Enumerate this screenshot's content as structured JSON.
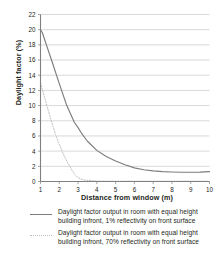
{
  "chart_data": {
    "type": "line",
    "title": "",
    "xlabel": "Distance from window (m)",
    "ylabel": "Daylight factor (%)",
    "xlim": [
      1,
      10
    ],
    "ylim": [
      0,
      22
    ],
    "xticks": [
      1,
      2,
      3,
      4,
      5,
      6,
      7,
      8,
      9,
      10
    ],
    "yticks": [
      0,
      2,
      4,
      6,
      8,
      10,
      12,
      14,
      16,
      18,
      20,
      22
    ],
    "xtick_labels": [
      "1",
      "2",
      "3",
      "4",
      "5",
      "6",
      "7",
      "8",
      "9",
      "10"
    ],
    "ytick_labels": [
      "0",
      "2",
      "4",
      "6",
      "8",
      "10",
      "12",
      "14",
      "16",
      "18",
      "20",
      "22"
    ],
    "grid": "horizontal",
    "legend_position": "bottom",
    "series": [
      {
        "name": "Daylight factor output in room with equal height building infront, 1% reflectivity on front surface",
        "style": "solid",
        "color": "#7d7d7d",
        "x": [
          1.0,
          1.1,
          1.3,
          1.6,
          2.0,
          2.4,
          2.8,
          3.0,
          3.2,
          3.5,
          4.0,
          4.5,
          5.0,
          5.5,
          6.0,
          6.5,
          7.0,
          7.5,
          8.0,
          8.5,
          9.0,
          9.5,
          10.0
        ],
        "y": [
          20.0,
          19.6,
          18.1,
          15.9,
          12.9,
          10.0,
          7.8,
          7.1,
          6.3,
          5.3,
          4.1,
          3.3,
          2.7,
          2.2,
          1.8,
          1.55,
          1.4,
          1.3,
          1.25,
          1.22,
          1.22,
          1.24,
          1.3
        ]
      },
      {
        "name": "Daylight factor output in room with equal height building infront, 70% reflectivity on front surface",
        "style": "dotted",
        "color": "#bfbfbf",
        "x": [
          1.0,
          1.2,
          1.5,
          1.8,
          2.0,
          2.2,
          2.5,
          2.8,
          3.0,
          3.3,
          4.0,
          5.0,
          6.0,
          7.0,
          8.0,
          9.0,
          10.0
        ],
        "y": [
          13.0,
          11.2,
          8.6,
          6.2,
          4.9,
          3.7,
          2.2,
          1.0,
          0.5,
          0.2,
          0.05,
          0.04,
          0.04,
          0.04,
          0.04,
          0.04,
          0.04
        ]
      }
    ]
  },
  "legend": {
    "items": [
      {
        "marker": "solid-line-swatch",
        "label": "Daylight factor output in room with equal height building infront, 1% reflectivity on front surface"
      },
      {
        "marker": "dotted-line-swatch",
        "label": "Daylight factor output in room with equal height building infront, 70% reflectivity on front surface"
      }
    ]
  },
  "colors": {
    "series_1": "#7d7d7d",
    "series_2": "#bfbfbf",
    "grid": "#c9c9c9",
    "axis": "#808080",
    "text": "#231f20"
  }
}
